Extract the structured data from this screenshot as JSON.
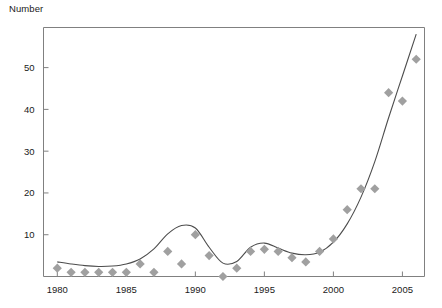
{
  "chart_data": {
    "type": "scatter",
    "title": "",
    "ylabel": "Number",
    "xlabel": "",
    "xlim": [
      1979.5,
      1986.5
    ],
    "ylim": [
      0,
      59
    ],
    "grid": false,
    "legend": null,
    "x_ticks": [
      1980,
      1985,
      1990,
      1995,
      2000,
      2005
    ],
    "y_ticks": [
      10,
      20,
      30,
      40,
      50
    ],
    "x": [
      1980,
      1981,
      1982,
      1983,
      1984,
      1985,
      1986,
      1987,
      1988,
      1989,
      1990,
      1991,
      1992,
      1993,
      1994,
      1995,
      1996,
      1997,
      1998,
      1999,
      2000,
      2001,
      2002,
      2003,
      2004,
      2005,
      2006
    ],
    "values": [
      2,
      1,
      1,
      1,
      1,
      1,
      3,
      1,
      6,
      3,
      10,
      5,
      0,
      2,
      6,
      6.5,
      6,
      4.5,
      3.5,
      6,
      9,
      16,
      21,
      21,
      44,
      42,
      52
    ],
    "series": [
      {
        "name": "observed",
        "marker": "diamond",
        "color": "#a0a0a0",
        "values": [
          2,
          1,
          1,
          1,
          1,
          1,
          3,
          1,
          6,
          3,
          10,
          5,
          0,
          2,
          6,
          6.5,
          6,
          4.5,
          3.5,
          6,
          9,
          16,
          21,
          21,
          44,
          42,
          52
        ]
      },
      {
        "name": "fitted-curve",
        "marker": "line",
        "color": "#4d4d4d",
        "values": [
          3.5,
          3.0,
          2.6,
          2.4,
          2.5,
          3.0,
          4.2,
          6.6,
          10.2,
          12.2,
          11.6,
          7.0,
          3.2,
          3.6,
          7.0,
          8.0,
          6.8,
          5.6,
          5.2,
          5.8,
          8.2,
          12.6,
          19.0,
          27.5,
          38.0,
          48.0,
          58.0
        ]
      }
    ]
  },
  "axis": {
    "y_title": "Number"
  },
  "colors": {
    "marker": "#a0a0a0",
    "curve": "#4d4d4d",
    "frame": "#808080",
    "text": "#1a1a1a"
  }
}
